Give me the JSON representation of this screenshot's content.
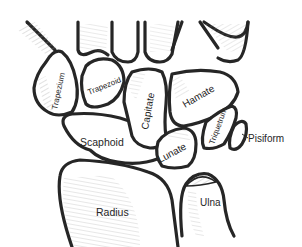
{
  "diagram": {
    "type": "anatomical line illustration",
    "colors": {
      "outline": "#262626",
      "hatching": "#8a8a8a",
      "background": "#ffffff"
    },
    "labels": {
      "trapezium": "Trapezium",
      "trapezoid": "Trapezoid",
      "capitate": "Capitate",
      "hamate": "Hamate",
      "triquetrum": "Triquetrum",
      "pisiform": "Pisiform",
      "scaphoid": "Scaphoid",
      "lunate": "Lunate",
      "radius": "Radius",
      "ulna": "Ulna"
    }
  }
}
